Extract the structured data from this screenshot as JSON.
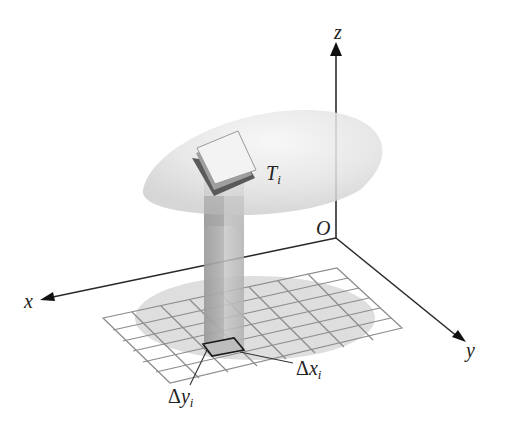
{
  "diagram": {
    "axes": {
      "x_label": "x",
      "y_label": "y",
      "z_label": "z",
      "origin_label": "O"
    },
    "surface_patch": {
      "label": "T",
      "subscript": "i"
    },
    "delta_x": {
      "symbol": "Δ",
      "var": "x",
      "subscript": "i"
    },
    "delta_y": {
      "symbol": "Δ",
      "var": "y",
      "subscript": "i"
    },
    "colors": {
      "axis": "#2a2a2a",
      "grid_line": "#8a8a8a",
      "region_shadow": "#dcdcdc",
      "dome": "#e4e4e4",
      "column": "#a9a9a9",
      "patch": "#f2f2f2"
    }
  }
}
